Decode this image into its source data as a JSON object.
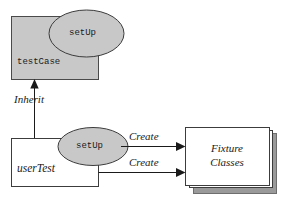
{
  "diagram": {
    "type": "uml-collaboration",
    "colors": {
      "shape_fill_gray": "#c8c8c8",
      "shape_fill_white": "#ffffff",
      "shadow_gray": "#9a9a9a",
      "stroke": "#3c3c3c",
      "text": "#1a1a1a",
      "background": "#ffffff"
    },
    "nodes": [
      {
        "id": "test-case-box",
        "shape": "rectangle",
        "label": "testCase",
        "font": "monospace",
        "fill": "#c8c8c8"
      },
      {
        "id": "test-case-setup-ellipse",
        "shape": "ellipse",
        "label": "setUp",
        "font": "monospace",
        "fill": "#c8c8c8"
      },
      {
        "id": "user-test-box",
        "shape": "rectangle",
        "label": "userTest",
        "font": "italic-serif",
        "fill": "#ffffff"
      },
      {
        "id": "user-test-setup-ellipse",
        "shape": "ellipse",
        "label": "setUp",
        "font": "monospace",
        "fill": "#c8c8c8"
      },
      {
        "id": "fixture-classes-stack",
        "shape": "rectangle-stack",
        "label_line1": "Fixture",
        "label_line2": "Classes",
        "font": "italic-serif",
        "fill": "#ffffff",
        "shadow_fill": "#9a9a9a"
      }
    ],
    "edges": [
      {
        "id": "inherit-edge",
        "from": "user-test-box",
        "to": "test-case-box",
        "label": "Inherit",
        "direction": "up",
        "arrowhead": "solid-triangle"
      },
      {
        "id": "create-edge-upper",
        "from": "user-test-setup-ellipse",
        "to": "fixture-classes-stack",
        "label": "Create",
        "direction": "right",
        "arrowhead": "solid-triangle"
      },
      {
        "id": "create-edge-lower",
        "from": "user-test-box",
        "to": "fixture-classes-stack",
        "label": "Create",
        "direction": "right",
        "arrowhead": "solid-triangle"
      }
    ]
  }
}
